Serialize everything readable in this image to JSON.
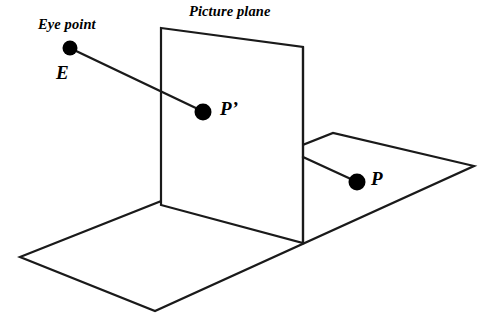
{
  "diagram": {
    "type": "perspective-projection-geometry",
    "background_color": "#ffffff",
    "stroke_color": "#1a1a1a",
    "dot_color": "#000000",
    "labels": {
      "eye_point": "Eye point",
      "picture_plane": "Picture plane",
      "point_e": "E",
      "point_p_prime": "P’",
      "point_p": "P"
    },
    "shapes": {
      "ground_plane": {
        "name": "ground-plane",
        "points": "20,257 333,133 474,166 155,311"
      },
      "picture_plane": {
        "name": "picture-plane",
        "points": "161,28 303,47 303,243 161,205"
      }
    },
    "lines": {
      "eye_to_projected": {
        "name": "sight-line-eye-to-p-prime",
        "x1": 74,
        "y1": 50,
        "x2": 200,
        "y2": 110
      },
      "plane_to_point": {
        "name": "sight-line-plane-to-p",
        "x1": 303,
        "y1": 157,
        "x2": 353,
        "y2": 180
      },
      "plane_vertical_front": {
        "name": "picture-plane-front-vertical-edge",
        "x1": 303,
        "y1": 47,
        "x2": 303,
        "y2": 243
      }
    },
    "dots": [
      {
        "name": "eye-point-dot",
        "cx": 70,
        "cy": 48,
        "r": 7.5
      },
      {
        "name": "p-prime-dot",
        "cx": 203,
        "cy": 112,
        "r": 8.5
      },
      {
        "name": "p-dot",
        "cx": 357,
        "cy": 182,
        "r": 8.5
      }
    ],
    "label_positions": {
      "eye_point": {
        "left": 38,
        "top": 17
      },
      "picture_plane": {
        "left": 189,
        "top": 4
      },
      "point_e": {
        "left": 56,
        "top": 63
      },
      "point_p_prime": {
        "left": 220,
        "top": 98
      },
      "point_p": {
        "left": 371,
        "top": 168
      }
    }
  }
}
